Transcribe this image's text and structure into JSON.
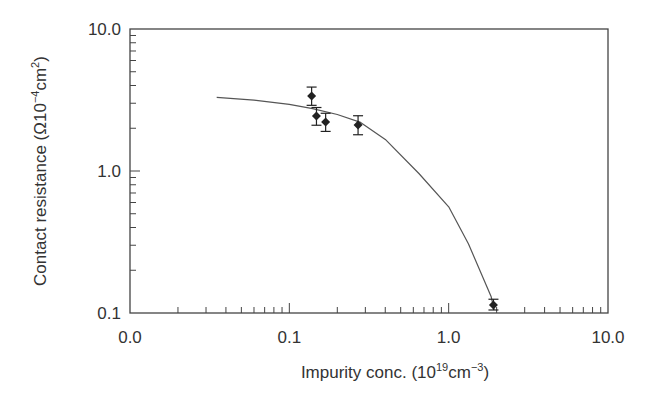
{
  "chart_data": {
    "type": "scatter",
    "title": "",
    "xlabel": "Impurity conc. (10^19 cm^-3)",
    "ylabel": "Contact resistance (Ω10^-4 cm^2)",
    "xscale": "log",
    "yscale": "log",
    "xlim": [
      0.01,
      10.0
    ],
    "ylim": [
      0.1,
      10.0
    ],
    "grid": false,
    "legend": null,
    "x_tick_labels": [
      "0.0",
      "0.1",
      "1.0",
      "10.0"
    ],
    "x_tick_values": [
      0.01,
      0.1,
      1.0,
      10.0
    ],
    "y_tick_labels": [
      "0.1",
      "1.0",
      "10.0"
    ],
    "y_tick_values": [
      0.1,
      1.0,
      10.0
    ],
    "series": [
      {
        "name": "Measured",
        "style": "diamond markers with error bars",
        "points": [
          {
            "x": 0.138,
            "y": 3.37,
            "y_err_low": 2.9,
            "y_err_high": 3.9
          },
          {
            "x": 0.148,
            "y": 2.44,
            "y_err_low": 2.1,
            "y_err_high": 2.8
          },
          {
            "x": 0.169,
            "y": 2.21,
            "y_err_low": 1.9,
            "y_err_high": 2.55
          },
          {
            "x": 0.27,
            "y": 2.11,
            "y_err_low": 1.8,
            "y_err_high": 2.45
          },
          {
            "x": 1.91,
            "y": 0.114,
            "y_err_low": 0.105,
            "y_err_high": 0.125
          }
        ]
      },
      {
        "name": "Fit",
        "style": "solid line",
        "points": [
          {
            "x": 0.035,
            "y": 3.3
          },
          {
            "x": 0.06,
            "y": 3.15
          },
          {
            "x": 0.1,
            "y": 2.95
          },
          {
            "x": 0.14,
            "y": 2.75
          },
          {
            "x": 0.2,
            "y": 2.5
          },
          {
            "x": 0.28,
            "y": 2.2
          },
          {
            "x": 0.4,
            "y": 1.67
          },
          {
            "x": 0.65,
            "y": 0.96
          },
          {
            "x": 1.0,
            "y": 0.56
          },
          {
            "x": 1.33,
            "y": 0.307
          },
          {
            "x": 1.6,
            "y": 0.19
          },
          {
            "x": 1.85,
            "y": 0.13
          },
          {
            "x": 1.93,
            "y": 0.105
          }
        ]
      }
    ]
  },
  "labels": {
    "x_axis_main": "Impurity conc. (10",
    "x_axis_sup1": "19",
    "x_axis_mid": "cm",
    "x_axis_sup2": "−3",
    "x_axis_end": ")",
    "y_axis_main": "Contact resistance (Ω10",
    "y_axis_sup1": "−4",
    "y_axis_mid": "cm",
    "y_axis_sup2": "2",
    "y_axis_end": ")"
  }
}
